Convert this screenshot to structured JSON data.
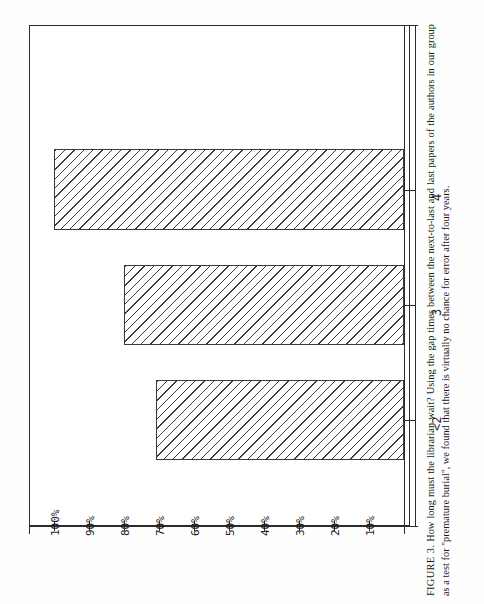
{
  "figure": {
    "caption_label": "FIGURE 3.",
    "caption_text": "How long must the librarian wait? Using the gap times between the next-to-last and last papers of the authors in our group as a test for ''premature burial'', we found that there is virtually no chance for error after four years.",
    "orientation": "rotated-90-ccw"
  },
  "chart_data": {
    "type": "bar",
    "orientation": "horizontal-on-page",
    "title": "",
    "xlabel": "",
    "ylabel": "",
    "categories": [
      "<2",
      "3",
      "4"
    ],
    "values": [
      71,
      80,
      100
    ],
    "value_suffix": "%",
    "ylim": [
      0,
      110
    ],
    "tick_values": [
      10,
      20,
      30,
      40,
      50,
      60,
      70,
      80,
      90,
      100
    ],
    "tick_labels": [
      "10%",
      "20%",
      "30%",
      "40%",
      "50%",
      "60%",
      "70%",
      "80%",
      "90%",
      "100%"
    ],
    "grid": false,
    "legend": null,
    "series": [
      {
        "name": "percent",
        "values": [
          71,
          80,
          100
        ]
      }
    ],
    "bar_fill": "diagonal-hatch",
    "bar_edge_color": "#3a3a3a",
    "background_color": "#ffffff"
  }
}
